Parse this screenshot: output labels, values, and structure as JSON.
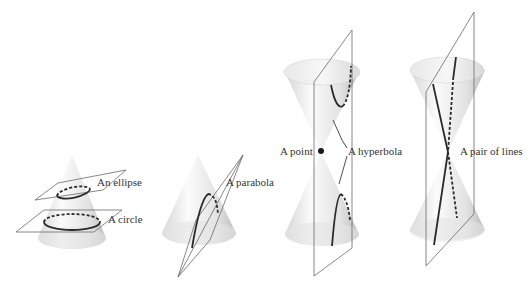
{
  "figure": {
    "panels": [
      {
        "name": "circle-ellipse",
        "labels": [
          "An ellipse",
          "A circle"
        ]
      },
      {
        "name": "parabola",
        "labels": [
          "A parabola"
        ]
      },
      {
        "name": "point-hyperbola",
        "labels": [
          "A point",
          "A hyperbola"
        ]
      },
      {
        "name": "pair-of-lines",
        "labels": [
          "A pair of lines"
        ]
      }
    ]
  },
  "labels": {
    "ellipse": "An ellipse",
    "circle": "A circle",
    "parabola": "A parabola",
    "point": "A point",
    "hyperbola": "A hyperbola",
    "lines": "A pair of lines"
  },
  "colors": {
    "cone_light": "#f4f4f4",
    "cone_dark": "#c8c8c8",
    "curve": "#2a2a2a",
    "plane": "#6a6a6a",
    "text": "#333333"
  }
}
